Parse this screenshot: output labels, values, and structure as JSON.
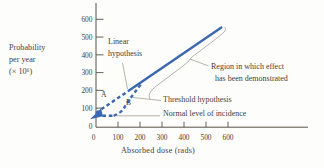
{
  "figure": {
    "background": "#fdfdfb",
    "text_color": "#46413a",
    "accent_blue": "#3a67b0",
    "leader_color": "#a49e93",
    "axis_color": "#56514a"
  },
  "chart_data": {
    "type": "line",
    "title": "",
    "xlabel": "Absorbed dose (rads)",
    "ylabel": "Probability per year (× 10⁶)",
    "ylabel_lines": [
      "Probability",
      "per year",
      "(× 10⁶)"
    ],
    "x_ticks": [
      0,
      100,
      200,
      300,
      400,
      500,
      600
    ],
    "y_ticks": [
      0,
      100,
      200,
      300,
      400,
      500,
      600
    ],
    "xlim": [
      0,
      960
    ],
    "ylim": [
      0,
      690
    ],
    "grid": false,
    "legend_position": "none",
    "normal_level_of_incidence": 57,
    "series": [
      {
        "name": "demonstrated-effect-line",
        "label": "Region in which effect has been demonstrated",
        "style": "solid",
        "points": [
          [
            145,
            195
          ],
          [
            573,
            557
          ]
        ]
      },
      {
        "name": "linear-hypothesis-extrapolation",
        "label": "Linear hypothesis",
        "style": "dashed",
        "points": [
          [
            0,
            73
          ],
          [
            145,
            195
          ]
        ]
      },
      {
        "name": "threshold-hypothesis-flat",
        "label": "Normal level of incidence",
        "style": "dashed",
        "points": [
          [
            0,
            57
          ],
          [
            80,
            57
          ]
        ]
      },
      {
        "name": "threshold-hypothesis-curve",
        "label": "Threshold hypothesis",
        "style": "dashed",
        "smooth": true,
        "points": [
          [
            80,
            57
          ],
          [
            115,
            72
          ],
          [
            145,
            140
          ],
          [
            205,
            235
          ]
        ]
      }
    ],
    "curve_labels": {
      "a": "A",
      "b": "B"
    },
    "annotations": {
      "linear": {
        "line1": "Linear",
        "line2": "hypothesis"
      },
      "threshold": {
        "text": "Threshold hypothesis"
      },
      "normal": {
        "text": "Normal level of incidence"
      },
      "region": {
        "line1": "Region in which effect",
        "line2": "has been demonstrated"
      }
    },
    "callouts_px": {
      "linear_leader": [
        [
          122.5,
          63
        ],
        [
          127.5,
          89
        ]
      ],
      "threshold_leader": [
        [
          161,
          100.5
        ],
        [
          133,
          97.5
        ]
      ],
      "normal_leader": [
        [
          160,
          115.8
        ],
        [
          117,
          115.8
        ]
      ],
      "region_leader": [
        [
          208.5,
          66
        ],
        [
          190,
          59
        ]
      ],
      "region_brace_path": "M 150 99 C 147 94 152 89 159 84 L 183 66 C 187 63 189 61 190 59 C 193 56 196 54 200 51 L 217 38 C 223 33 227 31 225 27",
      "origin_arrow": [
        [
          90,
          119.2
        ],
        [
          101,
          108.5
        ],
        [
          103,
          116.2
        ]
      ]
    }
  }
}
